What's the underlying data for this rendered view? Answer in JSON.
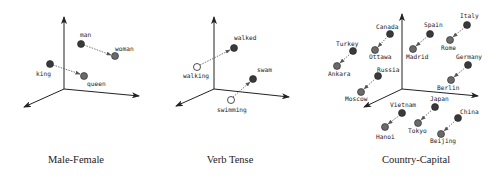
{
  "colors": {
    "axis": "#222222",
    "dot_dark": "#3a3a3a",
    "dot_mid": "#6a6a6a",
    "dot_open": "#ffffff",
    "arrow": "#555555"
  },
  "panels": [
    {
      "caption": "Male-Female",
      "points": [
        {
          "label": "man",
          "style": "dark"
        },
        {
          "label": "woman",
          "style": "mid"
        },
        {
          "label": "king",
          "style": "dark"
        },
        {
          "label": "queen",
          "style": "mid"
        }
      ],
      "relations": [
        [
          "man",
          "woman"
        ],
        [
          "king",
          "queen"
        ]
      ]
    },
    {
      "caption": "Verb Tense",
      "points": [
        {
          "label": "walked",
          "style": "dark"
        },
        {
          "label": "walking",
          "style": "open"
        },
        {
          "label": "swam",
          "style": "dark"
        },
        {
          "label": "swimming",
          "style": "open"
        }
      ],
      "relations": [
        [
          "walking",
          "walked"
        ],
        [
          "swimming",
          "swam"
        ]
      ]
    },
    {
      "caption": "Country-Capital",
      "points": [
        {
          "label": "Canada",
          "style": "dark"
        },
        {
          "label": "Ottawa",
          "style": "mid"
        },
        {
          "label": "Turkey",
          "style": "dark"
        },
        {
          "label": "Ankara",
          "style": "mid"
        },
        {
          "label": "Spain",
          "style": "dark"
        },
        {
          "label": "Madrid",
          "style": "mid"
        },
        {
          "label": "Italy",
          "style": "dark"
        },
        {
          "label": "Rome",
          "style": "mid"
        },
        {
          "label": "Russia",
          "style": "dark"
        },
        {
          "label": "Moscow",
          "style": "mid"
        },
        {
          "label": "Germany",
          "style": "dark"
        },
        {
          "label": "Berlin",
          "style": "mid"
        },
        {
          "label": "Vietnam",
          "style": "dark"
        },
        {
          "label": "Hanoi",
          "style": "mid"
        },
        {
          "label": "Japan",
          "style": "dark"
        },
        {
          "label": "Tokyo",
          "style": "mid"
        },
        {
          "label": "China",
          "style": "dark"
        },
        {
          "label": "Beijing",
          "style": "mid"
        }
      ],
      "relations": [
        [
          "Canada",
          "Ottawa"
        ],
        [
          "Turkey",
          "Ankara"
        ],
        [
          "Spain",
          "Madrid"
        ],
        [
          "Italy",
          "Rome"
        ],
        [
          "Russia",
          "Moscow"
        ],
        [
          "Germany",
          "Berlin"
        ],
        [
          "Vietnam",
          "Hanoi"
        ],
        [
          "Japan",
          "Tokyo"
        ],
        [
          "China",
          "Beijing"
        ]
      ]
    }
  ]
}
